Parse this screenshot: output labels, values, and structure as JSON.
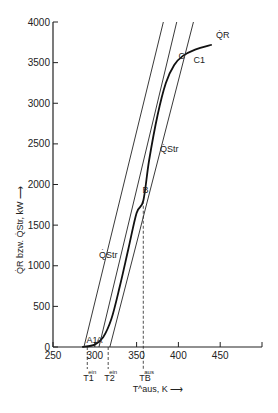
{
  "chart_data": {
    "type": "line",
    "title": "",
    "xlabel": "T^aus, K",
    "ylabel": "Q̇R bzw. Q̇Str, kW",
    "xlim": [
      250,
      500
    ],
    "ylim": [
      0,
      4000
    ],
    "x_ticks": [
      "250",
      "300",
      "350",
      "400",
      "450"
    ],
    "y_ticks": [
      "0",
      "500",
      "1000",
      "1500",
      "2000",
      "2500",
      "3000",
      "3500",
      "4000"
    ],
    "grid": false,
    "series": [
      {
        "name": "Q̇R",
        "label": "Q̇R",
        "style": "curve",
        "points": [
          [
            285,
            0
          ],
          [
            300,
            30
          ],
          [
            310,
            120
          ],
          [
            320,
            350
          ],
          [
            330,
            750
          ],
          [
            340,
            1200
          ],
          [
            350,
            1650
          ],
          [
            358,
            1800
          ],
          [
            365,
            2300
          ],
          [
            375,
            2850
          ],
          [
            385,
            3250
          ],
          [
            395,
            3470
          ],
          [
            405,
            3580
          ],
          [
            420,
            3660
          ],
          [
            440,
            3720
          ]
        ]
      },
      {
        "name": "Q̇Str line 1",
        "label": "Q̇Str",
        "style": "line",
        "points": [
          [
            287,
            0
          ],
          [
            382,
            4000
          ]
        ]
      },
      {
        "name": "Q̇Str line 2",
        "label": "Q̇Str",
        "style": "line",
        "points": [
          [
            305,
            0
          ],
          [
            398,
            4000
          ]
        ]
      },
      {
        "name": "Q̇Str line 3",
        "label": "Q̇Str",
        "style": "line",
        "points": [
          [
            318,
            0
          ],
          [
            418,
            4000
          ]
        ]
      }
    ],
    "annotations": [
      {
        "text": "A1",
        "x": 290,
        "y": 50
      },
      {
        "text": "A",
        "x": 302,
        "y": 50
      },
      {
        "text": "B",
        "x": 357,
        "y": 1900
      },
      {
        "text": "C",
        "x": 400,
        "y": 3550
      },
      {
        "text": "C1",
        "x": 418,
        "y": 3500
      },
      {
        "text": "Q̇R",
        "x": 445,
        "y": 3800
      },
      {
        "text": "Q̇Str",
        "x": 378,
        "y": 2400
      },
      {
        "text": "Q̇Str",
        "x": 305,
        "y": 1100
      }
    ],
    "markers": [
      {
        "label": "T1",
        "sup": "ein",
        "x": 291
      },
      {
        "label": "T2",
        "sup": "ein",
        "x": 316
      },
      {
        "label": "TB",
        "sup": "aus",
        "x": 358
      }
    ]
  }
}
